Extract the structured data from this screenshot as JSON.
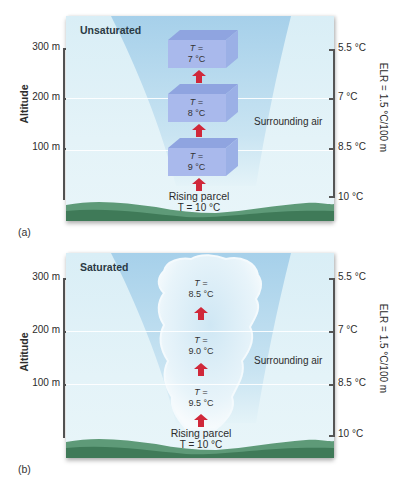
{
  "panels": [
    {
      "id": "a",
      "label": "(a)",
      "title": "Unsaturated",
      "altitude_axis": {
        "title": "Altitude",
        "ticks": [
          "300 m",
          "200 m",
          "100 m"
        ]
      },
      "temperature_axis": {
        "title": "ELR = 1.5 °C/100 m",
        "ticks": [
          "5.5 °C",
          "7 °C",
          "8.5 °C",
          "10 °C"
        ]
      },
      "surrounding_label": "Surrounding air",
      "rising_parcel": {
        "label": "Rising parcel",
        "temp": "T = 10 °C"
      },
      "parcels": [
        {
          "line1": "T =",
          "line2": "7 °C",
          "altitude": "300 m"
        },
        {
          "line1": "T =",
          "line2": "8 °C",
          "altitude": "200 m"
        },
        {
          "line1": "T =",
          "line2": "9 °C",
          "altitude": "100 m"
        }
      ]
    },
    {
      "id": "b",
      "label": "(b)",
      "title": "Saturated",
      "altitude_axis": {
        "title": "Altitude",
        "ticks": [
          "300 m",
          "200 m",
          "100 m"
        ]
      },
      "temperature_axis": {
        "title": "ELR = 1.5 °C/100 m",
        "ticks": [
          "5.5 °C",
          "7 °C",
          "8.5 °C",
          "10 °C"
        ]
      },
      "surrounding_label": "Surrounding air",
      "rising_parcel": {
        "label": "Rising parcel",
        "temp": "T = 10 °C"
      },
      "parcels": [
        {
          "line1": "T =",
          "line2": "8.5 °C",
          "altitude": "300 m"
        },
        {
          "line1": "T =",
          "line2": "9.0 °C",
          "altitude": "200 m"
        },
        {
          "line1": "T =",
          "line2": "9.5 °C",
          "altitude": "100 m"
        }
      ]
    }
  ],
  "colors": {
    "sky": "#dff0f7",
    "cone": "#a9d2ea",
    "cube_front": "#a7b8ea",
    "cube_top": "#8ea3e0",
    "arrow": "#d0283a",
    "ground": "#4f8a68",
    "cloud": "#f3f9fc"
  }
}
